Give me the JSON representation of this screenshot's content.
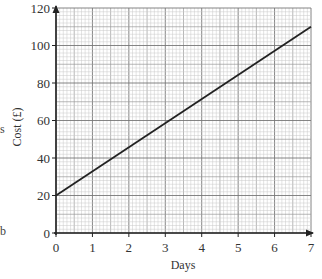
{
  "chart_data": {
    "type": "line",
    "title": "",
    "xlabel": "Days",
    "ylabel": "Cost (£)",
    "xlim": [
      0,
      7
    ],
    "ylim": [
      0,
      120
    ],
    "x_ticks": [
      0,
      1,
      2,
      3,
      4,
      5,
      6,
      7
    ],
    "y_ticks": [
      0,
      20,
      40,
      60,
      80,
      100,
      120
    ],
    "x_tick_labels": [
      "0",
      "1",
      "2",
      "3",
      "4",
      "5",
      "6",
      "7"
    ],
    "y_tick_labels": [
      "0",
      "20",
      "40",
      "60",
      "80",
      "100",
      "120"
    ],
    "grid": true,
    "grid_minor_x": 0.1,
    "grid_minor_y": 2,
    "legend": null,
    "series": [
      {
        "name": "Cost",
        "x": [
          0,
          7
        ],
        "y": [
          20,
          110
        ],
        "color": "#222222"
      }
    ]
  },
  "fragments": {
    "left_s": "s",
    "left_b": "b"
  },
  "colors": {
    "grid_minor": "#c8c8c8",
    "grid_mid": "#9a9a9a",
    "grid_major": "#777777",
    "axis": "#222222",
    "line": "#222222"
  }
}
